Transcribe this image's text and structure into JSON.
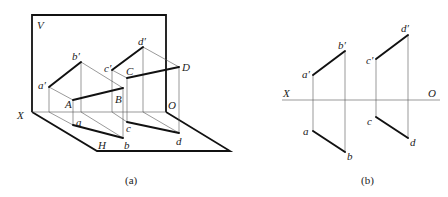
{
  "figure_a": {
    "caption": "(a)",
    "labels": {
      "V": "V",
      "H": "H",
      "X": "X",
      "O": "O",
      "A": "A",
      "B": "B",
      "C": "C",
      "D": "D",
      "a_prime": "a′",
      "b_prime": "b′",
      "c_prime": "c′",
      "d_prime": "d′",
      "a": "a",
      "b": "b",
      "c": "c",
      "d": "d"
    }
  },
  "figure_b": {
    "caption": "(b)",
    "labels": {
      "X": "X",
      "O": "O",
      "a_prime": "a′",
      "b_prime": "b′",
      "c_prime": "c′",
      "d_prime": "d′",
      "a": "a",
      "b": "b",
      "c": "c",
      "d": "d"
    }
  }
}
